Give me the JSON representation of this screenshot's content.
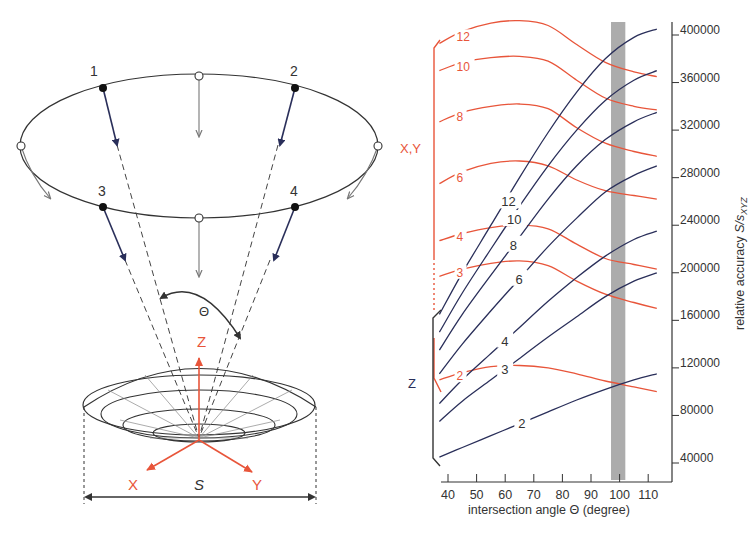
{
  "colors": {
    "red": "#e8553a",
    "blue": "#2a2f5a",
    "grey_band": "#9e9e9e",
    "axis": "#333333",
    "diagram_line": "#333333",
    "grey_arrow": "#777777"
  },
  "diagram": {
    "camera_labels": [
      "1",
      "2",
      "3",
      "4"
    ],
    "angle_label": "Θ",
    "axis_labels": {
      "z": "Z",
      "x": "X",
      "y": "Y"
    },
    "span_label": "S"
  },
  "chart_data": {
    "type": "line",
    "title": "",
    "xlabel": "intersection angle Θ (degree)",
    "ylabel": "relative accuracy S/s_XYZ",
    "ylabel_main": "relative accuracy ",
    "ylabel_var": "S/s",
    "ylabel_sub": "XYZ",
    "xlim": [
      37,
      113
    ],
    "ylim": [
      30000,
      410000
    ],
    "x_ticks": [
      40,
      50,
      60,
      70,
      80,
      90,
      100,
      110
    ],
    "y_ticks": [
      40000,
      80000,
      120000,
      160000,
      200000,
      240000,
      280000,
      320000,
      360000,
      400000
    ],
    "grid": false,
    "highlight_band": {
      "x_from": 97,
      "x_to": 102,
      "color": "#9e9e9e"
    },
    "group_labels": {
      "xy": "X,Y",
      "z": "Z"
    },
    "x": [
      37,
      45,
      55,
      65,
      75,
      85,
      95,
      105,
      113
    ],
    "series_xy": [
      {
        "name": "2",
        "values": [
          110000,
          116000,
          121000,
          122000,
          120000,
          115000,
          109000,
          104000,
          100000
        ]
      },
      {
        "name": "3",
        "values": [
          197000,
          203000,
          208000,
          210000,
          206000,
          193000,
          182000,
          175000,
          170000
        ]
      },
      {
        "name": "4",
        "values": [
          227000,
          233000,
          238000,
          240000,
          237000,
          224000,
          212000,
          207000,
          203000
        ]
      },
      {
        "name": "6",
        "values": [
          275000,
          285000,
          292000,
          294000,
          290000,
          278000,
          269000,
          265000,
          262000
        ]
      },
      {
        "name": "8",
        "values": [
          327000,
          335000,
          340000,
          342000,
          338000,
          322000,
          309000,
          302000,
          298000
        ]
      },
      {
        "name": "10",
        "values": [
          370000,
          377000,
          381000,
          382000,
          378000,
          362000,
          347000,
          340000,
          337000
        ]
      },
      {
        "name": "12",
        "values": [
          393000,
          403000,
          410000,
          412000,
          408000,
          392000,
          377000,
          369000,
          365000
        ]
      }
    ],
    "series_z": [
      {
        "name": "2",
        "values": [
          45000,
          53000,
          63000,
          73000,
          83000,
          93000,
          102000,
          110000,
          115000
        ]
      },
      {
        "name": "3",
        "values": [
          75000,
          92000,
          110000,
          128000,
          146000,
          163000,
          180000,
          193000,
          200000
        ]
      },
      {
        "name": "4",
        "values": [
          90000,
          110000,
          132000,
          154000,
          176000,
          196000,
          214000,
          228000,
          235000
        ]
      },
      {
        "name": "6",
        "values": [
          115000,
          140000,
          168000,
          195000,
          222000,
          246000,
          268000,
          282000,
          290000
        ]
      },
      {
        "name": "8",
        "values": [
          135000,
          165000,
          198000,
          230000,
          262000,
          290000,
          312000,
          327000,
          335000
        ]
      },
      {
        "name": "10",
        "values": [
          150000,
          183000,
          220000,
          256000,
          290000,
          320000,
          345000,
          362000,
          370000
        ]
      },
      {
        "name": "12",
        "values": [
          165000,
          200000,
          240000,
          280000,
          318000,
          352000,
          380000,
          398000,
          405000
        ]
      }
    ]
  }
}
